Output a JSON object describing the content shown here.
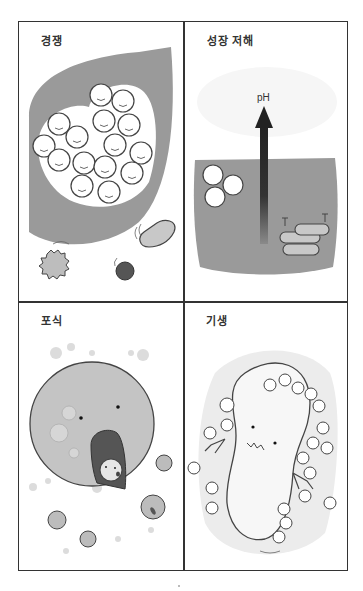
{
  "figure": {
    "panels": [
      {
        "id": "competition",
        "label": "경쟁"
      },
      {
        "id": "growth-inhibition",
        "label": "성장 저해",
        "arrow_label": "pH"
      },
      {
        "id": "predation",
        "label": "포식"
      },
      {
        "id": "parasitism",
        "label": "기생"
      }
    ]
  },
  "colors": {
    "border": "#333333",
    "gray_fill": "#9a9a9a",
    "light_gray": "#d0d0d0",
    "dark_cell": "#555555",
    "background": "#ffffff"
  }
}
